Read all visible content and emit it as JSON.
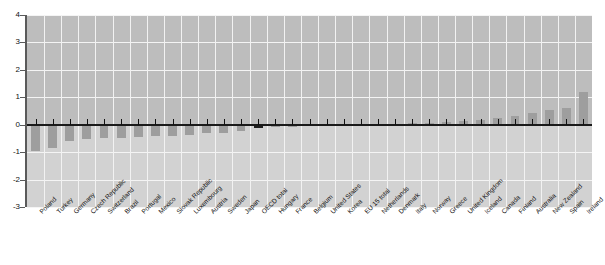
{
  "chart_data": {
    "type": "bar",
    "title": "",
    "xlabel": "",
    "ylabel": "",
    "ylim": [
      -3,
      4
    ],
    "yticks": [
      4,
      3,
      2,
      1,
      0,
      -1,
      -2,
      -3
    ],
    "grid": true,
    "legend": null,
    "highlight_category": "OECD total",
    "categories": [
      "Poland",
      "Turkey",
      "Germany",
      "Czech Republic",
      "Switzerland",
      "Brazil",
      "Portugal",
      "Mexico",
      "Slovak Republic",
      "Luxembourg",
      "Austria",
      "Sweden",
      "Japan",
      "OECD total",
      "Hungary",
      "France",
      "Belgium",
      "United States",
      "Korea",
      "EU 15 total",
      "Netherlands",
      "Denmark",
      "Italy",
      "Norway",
      "Greece",
      "United Kingdom",
      "Iceland",
      "Canada",
      "Finland",
      "Australia",
      "New Zealand",
      "Spain",
      "Ireland"
    ],
    "values": [
      -0.95,
      -0.85,
      -0.58,
      -0.52,
      -0.5,
      -0.5,
      -0.45,
      -0.42,
      -0.4,
      -0.38,
      -0.32,
      -0.3,
      -0.22,
      -0.12,
      -0.1,
      -0.08,
      -0.06,
      -0.05,
      -0.04,
      -0.04,
      -0.03,
      0.02,
      0.05,
      0.08,
      0.1,
      0.12,
      0.18,
      0.25,
      0.3,
      0.42,
      0.55,
      0.62,
      1.2
    ]
  },
  "axis": {
    "y_tick_labels": [
      "4",
      "3",
      "2",
      "1",
      "0",
      "-1",
      "-2",
      "-3"
    ]
  }
}
